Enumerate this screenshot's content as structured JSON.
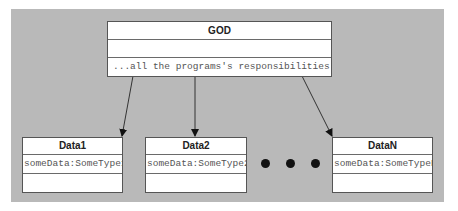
{
  "diagram": {
    "type": "uml-class-diagram",
    "god_class": {
      "name": "GOD",
      "attributes": "",
      "operations": "...all the programs's responsibilities..."
    },
    "data_classes": [
      {
        "name": "Data1",
        "attribute": "someData:SomeType1"
      },
      {
        "name": "Data2",
        "attribute": "someData:SomeType2"
      },
      {
        "name": "DataN",
        "attribute": "someData:SomeTypeN"
      }
    ],
    "ellipsis": "• • •",
    "relations": [
      {
        "from": "GOD",
        "to": "Data1",
        "kind": "association-arrow"
      },
      {
        "from": "GOD",
        "to": "Data2",
        "kind": "association-arrow"
      },
      {
        "from": "GOD",
        "to": "DataN",
        "kind": "association-arrow"
      }
    ],
    "colors": {
      "background": "#b9b9b9",
      "box": "#ffffff",
      "border": "#555555"
    }
  }
}
